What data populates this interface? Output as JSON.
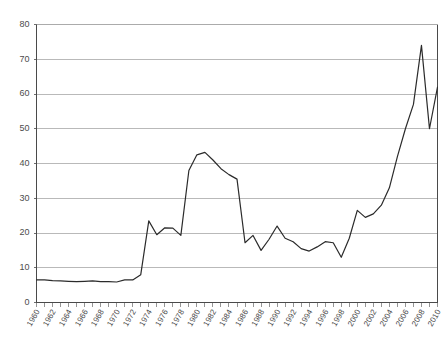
{
  "chart_data": {
    "type": "line",
    "title": "",
    "subtitle": "",
    "xlabel": "",
    "ylabel": "",
    "xlim": [
      1960,
      2010
    ],
    "ylim": [
      0,
      80
    ],
    "ytick_labels": [
      "0",
      "10",
      "20",
      "30",
      "40",
      "50",
      "60",
      "70",
      "80"
    ],
    "ytick_values": [
      0,
      10,
      20,
      30,
      40,
      50,
      60,
      70,
      80
    ],
    "xtick_labels": [
      "1960",
      "1962",
      "1964",
      "1966",
      "1968",
      "1970",
      "1972",
      "1974",
      "1976",
      "1978",
      "1980",
      "1982",
      "1984",
      "1986",
      "1988",
      "1990",
      "1992",
      "1994",
      "1996",
      "1998",
      "2000",
      "2002",
      "2004",
      "2006",
      "2008",
      "2010"
    ],
    "xtick_values": [
      1960,
      1962,
      1964,
      1966,
      1968,
      1970,
      1972,
      1974,
      1976,
      1978,
      1980,
      1982,
      1984,
      1986,
      1988,
      1990,
      1992,
      1994,
      1996,
      1998,
      2000,
      2002,
      2004,
      2006,
      2008,
      2010
    ],
    "xtick_minor_step": 1,
    "grid": "horizontal",
    "legend": "none",
    "series": [
      {
        "name": "series-1",
        "color": "#2b2b2b",
        "x": [
          1960,
          1961,
          1962,
          1963,
          1964,
          1965,
          1966,
          1967,
          1968,
          1969,
          1970,
          1971,
          1972,
          1973,
          1974,
          1975,
          1976,
          1977,
          1978,
          1979,
          1980,
          1981,
          1982,
          1983,
          1984,
          1985,
          1986,
          1987,
          1988,
          1989,
          1990,
          1991,
          1992,
          1993,
          1994,
          1995,
          1996,
          1997,
          1998,
          1999,
          2000,
          2001,
          2002,
          2003,
          2004,
          2005,
          2006,
          2007,
          2008,
          2009,
          2010
        ],
        "y": [
          6.5,
          6.5,
          6.3,
          6.2,
          6.1,
          6.0,
          6.1,
          6.2,
          6.0,
          6.0,
          5.9,
          6.5,
          6.5,
          8.0,
          23.5,
          19.5,
          21.5,
          21.4,
          19.3,
          38.0,
          42.5,
          43.2,
          41.0,
          38.5,
          36.8,
          35.5,
          17.2,
          19.3,
          15.0,
          18.2,
          22.0,
          18.5,
          17.5,
          15.5,
          14.8,
          16.0,
          17.5,
          17.2,
          13.0,
          18.5,
          26.5,
          24.5,
          25.5,
          28.0,
          33.0,
          42.0,
          50.0,
          57.0,
          74.0,
          50.0,
          62.0
        ]
      }
    ],
    "annotations": []
  },
  "meta": {
    "clipped_title_fragment": ""
  }
}
